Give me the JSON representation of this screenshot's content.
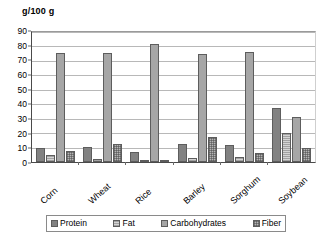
{
  "chart_data": {
    "type": "bar",
    "title": "",
    "xlabel": "",
    "ylabel": "g/100 g",
    "axis_title": "g/100 g",
    "ylim": [
      0,
      90
    ],
    "ytick_step": 10,
    "yticks": [
      90,
      80,
      70,
      60,
      50,
      40,
      30,
      20,
      10,
      0
    ],
    "grid": true,
    "grid_orientation": "horizontal",
    "legend_position": "bottom",
    "categories": [
      "Corn",
      "Wheat",
      "Rice",
      "Barley",
      "Sorghum",
      "Soybean"
    ],
    "series": [
      {
        "name": "Protein",
        "color": "#828282",
        "pattern": "solid",
        "values": [
          9.5,
          10.5,
          7.0,
          12.3,
          11.4,
          36.8
        ]
      },
      {
        "name": "Fat",
        "color": "#d4d4d4",
        "pattern": "horizontal-lines",
        "values": [
          4.5,
          1.9,
          1.0,
          2.4,
          3.7,
          19.8
        ]
      },
      {
        "name": "Carbohydrates",
        "color": "#a6a6a6",
        "pattern": "solid",
        "values": [
          74.0,
          74.2,
          80.2,
          73.5,
          75.0,
          30.8
        ]
      },
      {
        "name": "Fiber",
        "color": "#b5b5b5",
        "pattern": "checkered",
        "values": [
          7.2,
          12.3,
          1.3,
          17.3,
          6.3,
          9.5
        ]
      }
    ]
  },
  "legend": {
    "items": [
      {
        "label": "Protein"
      },
      {
        "label": "Fat"
      },
      {
        "label": "Carbohydrates"
      },
      {
        "label": "Fiber"
      }
    ]
  }
}
